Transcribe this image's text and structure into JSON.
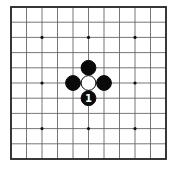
{
  "board": {
    "size": 11,
    "origin_x": 11,
    "origin_y": 7,
    "cell_w": 15.5,
    "cell_h": 15.2,
    "border_color": "#222222",
    "line_color": "#666666",
    "background": "#ffffff",
    "star_points": [
      [
        2,
        2
      ],
      [
        5,
        2
      ],
      [
        8,
        2
      ],
      [
        2,
        5
      ],
      [
        8,
        5
      ],
      [
        2,
        8
      ],
      [
        5,
        8
      ],
      [
        8,
        8
      ]
    ],
    "stones": [
      {
        "col": 5,
        "row": 4,
        "color": "black",
        "label": ""
      },
      {
        "col": 4,
        "row": 5,
        "color": "black",
        "label": ""
      },
      {
        "col": 6,
        "row": 5,
        "color": "black",
        "label": ""
      },
      {
        "col": 5,
        "row": 5,
        "color": "white",
        "label": ""
      },
      {
        "col": 5,
        "row": 6,
        "color": "black",
        "label": "1"
      }
    ]
  }
}
